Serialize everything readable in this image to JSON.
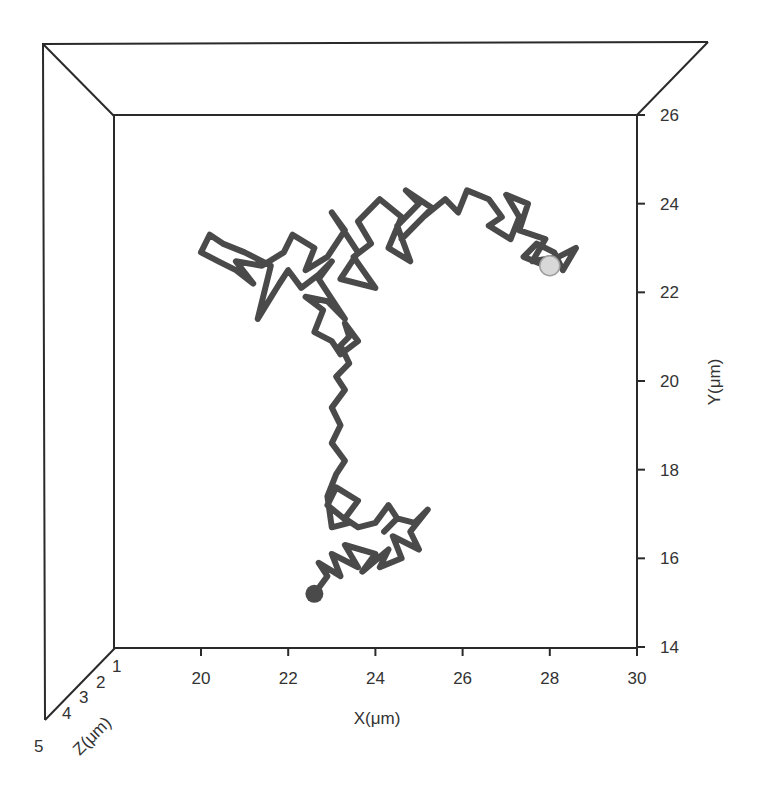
{
  "chart_data": {
    "type": "line",
    "subtype": "3d-trajectory",
    "title": "",
    "xlabel": "X(μm)",
    "ylabel": "Y(μm)",
    "zlabel": "Z(μm)",
    "xlim": [
      18,
      30
    ],
    "ylim": [
      14,
      26
    ],
    "zlim": [
      1,
      5
    ],
    "x_ticks": [
      20,
      22,
      24,
      26,
      28,
      30
    ],
    "y_ticks": [
      14,
      16,
      18,
      20,
      22,
      24,
      26
    ],
    "z_ticks": [
      1,
      2,
      3,
      4,
      5
    ],
    "grid": false,
    "legend": null,
    "colors": {
      "trajectory": "#4a4a4a",
      "frame": "#2a2a2a",
      "end_marker": "#d8d8d8"
    },
    "series": [
      {
        "name": "particle trajectory",
        "start": {
          "x": 22.6,
          "y": 15.2
        },
        "end": {
          "x": 28.0,
          "y": 22.6
        },
        "x": [
          22.6,
          22.9,
          22.7,
          23.2,
          23.0,
          23.6,
          23.3,
          24.0,
          23.7,
          24.3,
          24.1,
          24.6,
          24.4,
          25.0,
          24.8,
          25.2,
          24.9,
          24.5,
          24.2,
          24.5,
          24.3,
          24.0,
          23.6,
          23.3,
          23.6,
          23.1,
          22.9,
          23.4,
          23.0,
          22.9,
          23.1,
          23.3,
          23.0,
          23.2,
          23.0,
          23.3,
          23.1,
          23.4,
          23.2,
          23.4,
          23.3,
          23.6,
          23.2,
          23.0,
          22.6,
          22.8,
          22.4,
          22.9,
          23.3,
          22.9,
          22.7,
          23.0,
          22.7,
          22.3,
          22.0,
          21.8,
          21.3,
          21.6,
          21.0,
          20.5,
          20.2,
          20.0,
          20.4,
          20.8,
          21.2,
          20.8,
          21.4,
          21.9,
          22.1,
          22.6,
          22.4,
          22.9,
          23.3,
          23.0,
          23.6,
          23.2,
          24.0,
          23.5,
          23.9,
          23.6,
          24.1,
          24.6,
          24.3,
          24.8,
          24.5,
          25.0,
          24.7,
          25.3,
          24.9,
          24.6,
          25.1,
          25.6,
          25.9,
          26.1,
          26.6,
          26.9,
          26.6,
          27.1,
          27.3,
          27.0,
          27.5,
          27.3,
          27.9,
          27.6,
          28.2,
          28.6,
          28.3,
          28.1,
          27.7,
          27.4,
          27.9,
          28.0
        ],
        "y": [
          15.2,
          15.6,
          15.9,
          15.6,
          16.1,
          15.8,
          16.3,
          16.1,
          15.7,
          16.2,
          15.8,
          16.0,
          16.5,
          16.2,
          16.6,
          17.1,
          16.8,
          16.9,
          16.6,
          16.9,
          17.2,
          16.8,
          16.7,
          16.9,
          17.3,
          17.6,
          17.2,
          16.8,
          16.7,
          17.4,
          17.9,
          18.2,
          18.6,
          19.0,
          19.4,
          19.8,
          20.1,
          20.4,
          20.8,
          21.0,
          21.3,
          20.9,
          20.6,
          20.9,
          21.1,
          21.6,
          21.9,
          21.8,
          21.4,
          22.0,
          22.3,
          22.7,
          22.4,
          22.1,
          22.5,
          22.2,
          21.4,
          22.6,
          22.9,
          23.1,
          23.3,
          22.9,
          22.7,
          22.5,
          22.2,
          22.7,
          22.6,
          22.9,
          23.3,
          23.0,
          22.5,
          22.8,
          23.4,
          23.8,
          22.9,
          22.3,
          22.1,
          22.8,
          23.1,
          23.6,
          24.1,
          23.7,
          23.0,
          22.7,
          23.5,
          24.0,
          24.3,
          23.9,
          23.5,
          23.2,
          23.7,
          24.1,
          23.8,
          24.3,
          24.1,
          23.7,
          23.5,
          23.2,
          23.7,
          24.2,
          24.0,
          23.4,
          23.2,
          22.7,
          22.8,
          23.0,
          22.5,
          22.9,
          23.1,
          22.8,
          22.6,
          22.6
        ]
      }
    ]
  },
  "labels": {
    "x_axis": "X(μm)",
    "y_axis": "Y(μm)",
    "z_axis": "Z(μm)",
    "x_ticks": [
      "20",
      "22",
      "24",
      "26",
      "28",
      "30"
    ],
    "y_ticks": [
      "26",
      "24",
      "22",
      "20",
      "18",
      "16",
      "14"
    ],
    "z_ticks": [
      "1",
      "2",
      "3",
      "4",
      "5"
    ]
  }
}
